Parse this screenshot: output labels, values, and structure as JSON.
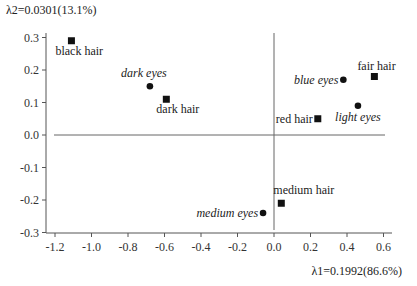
{
  "chart_data": {
    "type": "scatter",
    "title": "",
    "xlabel": "λ1=0.1992(86.6%)",
    "ylabel": "λ2=0.0301(13.1%)",
    "xlim": [
      -1.25,
      0.65
    ],
    "ylim": [
      -0.31,
      0.32
    ],
    "x_ticks": [
      -1.2,
      -1.0,
      -0.8,
      -0.6,
      -0.4,
      -0.2,
      0.0,
      0.2,
      0.4,
      0.6
    ],
    "x_tick_labels": [
      "-1.2",
      "-1.0",
      "-0.8",
      "-0.6",
      "-0.4",
      "-0.2",
      "0.0",
      "0.2",
      "0.4",
      "0.6"
    ],
    "y_ticks": [
      0.3,
      0.2,
      0.1,
      0.0,
      -0.1,
      -0.2,
      -0.3
    ],
    "y_tick_labels": [
      "0.3",
      "0.2",
      "0.1",
      "0.0",
      "-0.1",
      "-0.2",
      "-0.3"
    ],
    "grid": false,
    "reference_lines": {
      "x": 0.0,
      "y": 0.0
    },
    "series": [
      {
        "name": "hair color",
        "marker": "square",
        "points": [
          {
            "label": "black hair",
            "x": -1.11,
            "y": 0.29
          },
          {
            "label": "dark hair",
            "x": -0.59,
            "y": 0.11
          },
          {
            "label": "fair hair",
            "x": 0.55,
            "y": 0.18
          },
          {
            "label": "red hair",
            "x": 0.24,
            "y": 0.05
          },
          {
            "label": "medium hair",
            "x": 0.04,
            "y": -0.21
          }
        ]
      },
      {
        "name": "eye color",
        "marker": "circle",
        "italic": true,
        "points": [
          {
            "label": "dark eyes",
            "x": -0.68,
            "y": 0.15
          },
          {
            "label": "blue eyes",
            "x": 0.38,
            "y": 0.17
          },
          {
            "label": "light eyes",
            "x": 0.46,
            "y": 0.09
          },
          {
            "label": "medium eyes",
            "x": -0.06,
            "y": -0.24
          }
        ]
      }
    ]
  }
}
